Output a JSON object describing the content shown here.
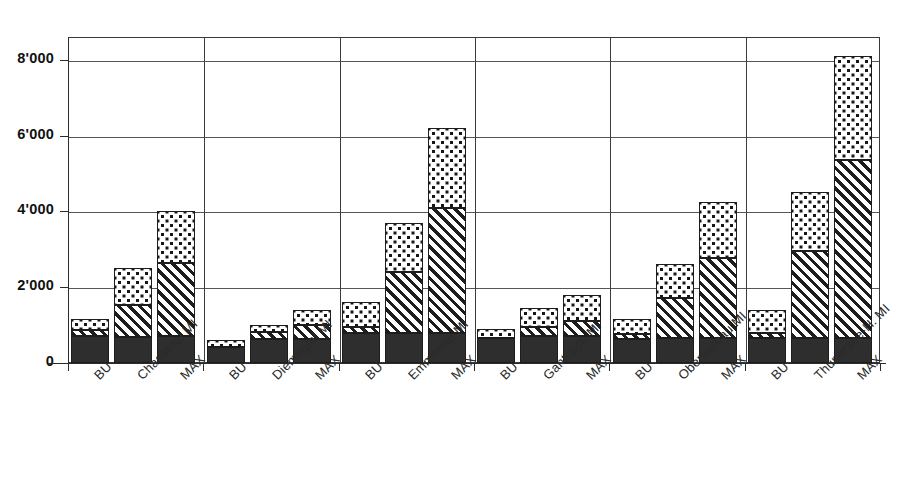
{
  "chart_data": {
    "type": "bar",
    "stacked": true,
    "title": "",
    "subtitle": "",
    "xlabel": "",
    "ylabel": "",
    "ylim": [
      0,
      8600
    ],
    "yticks": [
      0,
      2000,
      4000,
      6000,
      8000
    ],
    "ytick_labels": [
      "0",
      "2'000",
      "4'000",
      "6'000",
      "8'000"
    ],
    "grid": true,
    "legend": "none",
    "groups": [
      "Chasseral",
      "Diemtigtal",
      "Emmental",
      "Gantrisch",
      "Oberaargau",
      "Thunersee-H."
    ],
    "scenarios": [
      "BU",
      "MI",
      "MAX"
    ],
    "series": [
      {
        "name": "segment-1-solid",
        "pattern": "solid-dark"
      },
      {
        "name": "segment-2-hatch",
        "pattern": "diagonal-hatch"
      },
      {
        "name": "segment-3-dots",
        "pattern": "speckled-dots"
      }
    ],
    "categories": [
      "BU",
      "Chasseral MI",
      "MAX",
      "BU",
      "Diemtigtal MI",
      "MAX",
      "BU",
      "Emmental MI",
      "MAX",
      "BU",
      "Gantrisch MI",
      "MAX",
      "BU",
      "Oberaargau MI",
      "MAX",
      "BU",
      "Thunersee-H. MI",
      "MAX"
    ],
    "bars": [
      {
        "group": "Chasseral",
        "scenario": "BU",
        "label": "BU",
        "solid": 700,
        "hatch": 160,
        "dots": 290,
        "total": 1150
      },
      {
        "group": "Chasseral",
        "scenario": "MI",
        "label": "Chasseral MI",
        "solid": 680,
        "hatch": 850,
        "dots": 970,
        "total": 2500
      },
      {
        "group": "Chasseral",
        "scenario": "MAX",
        "label": "MAX",
        "solid": 700,
        "hatch": 1950,
        "dots": 1350,
        "total": 4000
      },
      {
        "group": "Diemtigtal",
        "scenario": "BU",
        "label": "BU",
        "solid": 430,
        "hatch": 0,
        "dots": 170,
        "total": 600
      },
      {
        "group": "Diemtigtal",
        "scenario": "MI",
        "label": "Diemtigtal MI",
        "solid": 640,
        "hatch": 190,
        "dots": 170,
        "total": 1000
      },
      {
        "group": "Diemtigtal",
        "scenario": "MAX",
        "label": "MAX",
        "solid": 640,
        "hatch": 360,
        "dots": 400,
        "total": 1400
      },
      {
        "group": "Emmental",
        "scenario": "BU",
        "label": "BU",
        "solid": 800,
        "hatch": 160,
        "dots": 640,
        "total": 1600
      },
      {
        "group": "Emmental",
        "scenario": "MI",
        "label": "Emmental MI",
        "solid": 800,
        "hatch": 1600,
        "dots": 1300,
        "total": 3700
      },
      {
        "group": "Emmental",
        "scenario": "MAX",
        "label": "MAX",
        "solid": 800,
        "hatch": 3300,
        "dots": 2100,
        "total": 6200
      },
      {
        "group": "Gantrisch",
        "scenario": "BU",
        "label": "BU",
        "solid": 660,
        "hatch": 0,
        "dots": 240,
        "total": 900
      },
      {
        "group": "Gantrisch",
        "scenario": "MI",
        "label": "Gantrisch MI",
        "solid": 700,
        "hatch": 250,
        "dots": 500,
        "total": 1450
      },
      {
        "group": "Gantrisch",
        "scenario": "MAX",
        "label": "MAX",
        "solid": 700,
        "hatch": 400,
        "dots": 700,
        "total": 1800
      },
      {
        "group": "Oberaargau",
        "scenario": "BU",
        "label": "BU",
        "solid": 640,
        "hatch": 130,
        "dots": 380,
        "total": 1150
      },
      {
        "group": "Oberaargau",
        "scenario": "MI",
        "label": "Oberaargau MI",
        "solid": 660,
        "hatch": 1060,
        "dots": 880,
        "total": 2600
      },
      {
        "group": "Oberaargau",
        "scenario": "MAX",
        "label": "MAX",
        "solid": 660,
        "hatch": 2120,
        "dots": 1470,
        "total": 4250
      },
      {
        "group": "Thunersee-H.",
        "scenario": "BU",
        "label": "BU",
        "solid": 660,
        "hatch": 130,
        "dots": 610,
        "total": 1400
      },
      {
        "group": "Thunersee-H.",
        "scenario": "MI",
        "label": "Thunersee-H. MI",
        "solid": 650,
        "hatch": 2300,
        "dots": 1550,
        "total": 4500
      },
      {
        "group": "Thunersee-H.",
        "scenario": "MAX",
        "label": "MAX",
        "solid": 650,
        "hatch": 4700,
        "dots": 2750,
        "total": 8100
      }
    ]
  },
  "page": {
    "cropped_header_fragment": "  "
  }
}
